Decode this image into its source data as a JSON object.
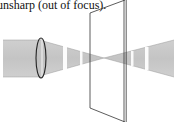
{
  "caption": {
    "text": "unsharp (out of focus)."
  },
  "diagram": {
    "elements": [
      "incoming-beam",
      "convex-lens",
      "converging-cone",
      "focal-point",
      "diverging-cone",
      "screen-plate"
    ],
    "colors": {
      "beam": "#c9c9c9",
      "stroke": "#333333",
      "highlight": "#ffffff"
    }
  }
}
